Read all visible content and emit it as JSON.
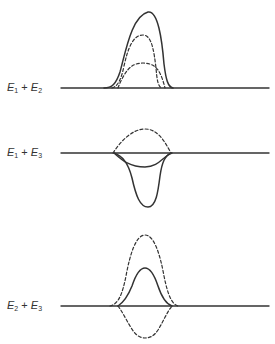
{
  "panels": [
    {
      "label": {
        "a": "E",
        "a_sub": "1",
        "op": "+",
        "b": "E",
        "b_sub": "2"
      },
      "baseline_y": 88
    },
    {
      "label": {
        "a": "E",
        "a_sub": "1",
        "op": "+",
        "b": "E",
        "b_sub": "3"
      },
      "baseline_y": 153
    },
    {
      "label": {
        "a": "E",
        "a_sub": "2",
        "op": "+",
        "b": "E",
        "b_sub": "3"
      },
      "baseline_y": 306
    }
  ],
  "colors": {
    "stroke": "#333333",
    "background": "#ffffff"
  }
}
